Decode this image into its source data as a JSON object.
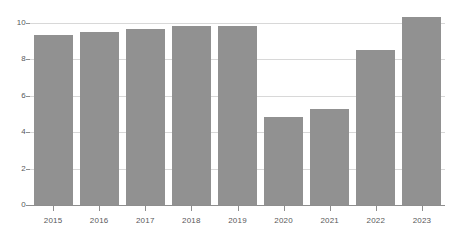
{
  "chart_data": {
    "type": "bar",
    "title": "",
    "subtitle": "",
    "xlabel": "",
    "ylabel": "",
    "categories": [
      "2015",
      "2016",
      "2017",
      "2018",
      "2019",
      "2020",
      "2021",
      "2022",
      "2023"
    ],
    "values": [
      9.35,
      9.5,
      9.65,
      9.85,
      9.85,
      4.85,
      5.25,
      8.5,
      10.3
    ],
    "series": [
      {
        "name": "",
        "values": [
          9.35,
          9.5,
          9.65,
          9.85,
          9.85,
          4.85,
          5.25,
          8.5,
          10.3
        ]
      }
    ],
    "ylim": [
      0,
      10.7
    ],
    "xlim": [
      0,
      9
    ],
    "yticks": [
      0,
      2,
      4,
      6,
      8,
      10
    ],
    "ytick_labels": [
      "0",
      "2",
      "4",
      "6",
      "8",
      "10"
    ],
    "grid": true,
    "grid_axis": "y",
    "legend": false,
    "legend_position": "none",
    "bar_color": "#919191",
    "gridline_color": "#d8d8d8",
    "axis_color": "#8e8e8e",
    "tick_label_color": "#58585a",
    "background_color": "#ffffff"
  }
}
